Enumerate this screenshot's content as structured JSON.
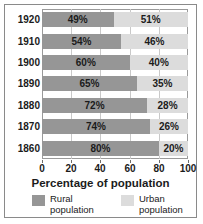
{
  "chart_data": {
    "type": "bar",
    "orientation": "horizontal",
    "stacked": true,
    "title": "",
    "xlabel": "Percentage of population",
    "ylabel": "",
    "xlim": [
      0,
      100
    ],
    "xticks": [
      0,
      20,
      40,
      60,
      80,
      100
    ],
    "xtick_labels": [
      "0",
      "20",
      "40",
      "60",
      "80",
      "100"
    ],
    "categories": [
      "1920",
      "1910",
      "1900",
      "1890",
      "1880",
      "1870",
      "1860"
    ],
    "grid": true,
    "legend_position": "bottom",
    "series": [
      {
        "name": "Rural population",
        "color": "#969696",
        "values": [
          49,
          54,
          60,
          65,
          72,
          74,
          80
        ],
        "value_labels": [
          "49%",
          "54%",
          "60%",
          "65%",
          "72%",
          "74%",
          "80%"
        ]
      },
      {
        "name": "Urban population",
        "color": "#dcdcdc",
        "values": [
          51,
          46,
          40,
          35,
          28,
          26,
          20
        ],
        "value_labels": [
          "51%",
          "46%",
          "40%",
          "35%",
          "28%",
          "26%",
          "20%"
        ]
      }
    ],
    "rows": [
      {
        "year": "1920",
        "rural": 49,
        "urban": 51,
        "rural_label": "49%",
        "urban_label": "51%"
      },
      {
        "year": "1910",
        "rural": 54,
        "urban": 46,
        "rural_label": "54%",
        "urban_label": "46%"
      },
      {
        "year": "1900",
        "rural": 60,
        "urban": 40,
        "rural_label": "60%",
        "urban_label": "40%"
      },
      {
        "year": "1890",
        "rural": 65,
        "urban": 35,
        "rural_label": "65%",
        "urban_label": "35%"
      },
      {
        "year": "1880",
        "rural": 72,
        "urban": 28,
        "rural_label": "72%",
        "urban_label": "28%"
      },
      {
        "year": "1870",
        "rural": 74,
        "urban": 26,
        "rural_label": "74%",
        "urban_label": "26%"
      },
      {
        "year": "1860",
        "rural": 80,
        "urban": 20,
        "rural_label": "80%",
        "urban_label": "20%"
      }
    ]
  },
  "axis": {
    "x_title": "Percentage of population"
  },
  "legend": {
    "items": [
      {
        "label_line1": "Rural",
        "label_line2": "population",
        "color": "#969696"
      },
      {
        "label_line1": "Urban",
        "label_line2": "population",
        "color": "#dcdcdc"
      }
    ]
  },
  "colors": {
    "rural": "#969696",
    "urban": "#dcdcdc",
    "frame": "#8a8a8a",
    "plot_frame": "#9a9a9a",
    "grid": "#c9c9c9",
    "text": "#1b1b1b",
    "background": "#ffffff"
  }
}
